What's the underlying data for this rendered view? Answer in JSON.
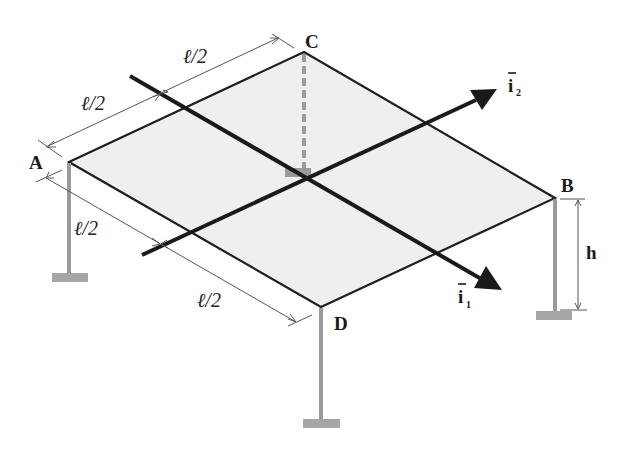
{
  "diagram": {
    "colors": {
      "plate_fill": "#efefef",
      "plate_edge": "#1e1e1e",
      "column": "#9a9a9a",
      "footing": "#a6a6a6",
      "axis": "#1a1a1a",
      "dimension": "#555555"
    },
    "nodes": {
      "A": {
        "label": "A"
      },
      "B": {
        "label": "B"
      },
      "C": {
        "label": "C"
      },
      "D": {
        "label": "D"
      }
    },
    "dimensions": {
      "AC_first_half": "ℓ/2",
      "AC_second_half": "ℓ/2",
      "AD_first_half": "ℓ/2",
      "AD_second_half": "ℓ/2",
      "height": "h"
    },
    "axes": {
      "i1": {
        "label": "i",
        "subscript": "1"
      },
      "i2": {
        "label": "i",
        "subscript": "2"
      }
    }
  }
}
